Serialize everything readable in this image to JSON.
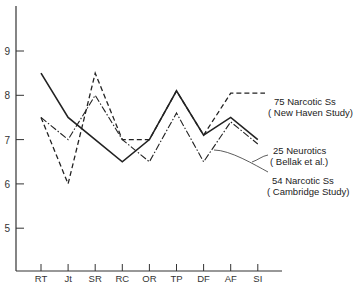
{
  "chart_data": {
    "type": "line",
    "title": "",
    "xlabel": "",
    "ylabel": "",
    "ylim": [
      4,
      10
    ],
    "yticks": [
      5,
      6,
      7,
      8,
      9
    ],
    "grid": false,
    "categories": [
      "RT",
      "Jt",
      "SR",
      "RC",
      "OR",
      "TP",
      "DF",
      "AF",
      "SI"
    ],
    "series": [
      {
        "name": "75 Narcotic Ss (New Haven Study)",
        "style": "dashed",
        "values": [
          7.5,
          6.0,
          8.5,
          7.0,
          7.0,
          8.1,
          7.1,
          8.05,
          8.1
        ]
      },
      {
        "name": "25 Neurotics (Bellak et al.)",
        "style": "solid",
        "values": [
          8.5,
          7.5,
          7.0,
          6.5,
          7.0,
          8.1,
          7.1,
          7.5,
          7.0
        ]
      },
      {
        "name": "54 Narcotic Ss (Cambridge Study)",
        "style": "dash-dot",
        "values": [
          7.5,
          7.0,
          8.0,
          7.0,
          6.5,
          7.6,
          6.5,
          7.4,
          6.9
        ]
      }
    ],
    "legend_position": "right, inline labels with leader lines"
  },
  "labels": {
    "new_haven": {
      "line1": "75 Narcotic Ss",
      "line2": "( New Haven Study)"
    },
    "bellak": {
      "line1": "25 Neurotics",
      "line2": "( Bellak et al.)"
    },
    "cambridge": {
      "line1": "54 Narcotic Ss",
      "line2": "( Cambridge Study)"
    }
  }
}
